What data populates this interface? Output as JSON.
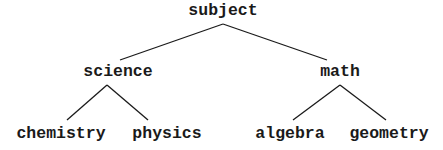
{
  "diagram": {
    "type": "tree",
    "line_color": "#1a1a1a",
    "nodes": {
      "root": {
        "label": "subject",
        "x": 223,
        "y": 2
      },
      "science": {
        "label": "science",
        "x": 118,
        "y": 63
      },
      "math": {
        "label": "math",
        "x": 340,
        "y": 63
      },
      "chemistry": {
        "label": "chemistry",
        "x": 61,
        "y": 125
      },
      "physics": {
        "label": "physics",
        "x": 167,
        "y": 125
      },
      "algebra": {
        "label": "algebra",
        "x": 290,
        "y": 125
      },
      "geometry": {
        "label": "geometry",
        "x": 389,
        "y": 125
      }
    },
    "edges": [
      {
        "from": "subject",
        "to": "science",
        "x1": 223,
        "y1": 24,
        "x2": 120,
        "y2": 60
      },
      {
        "from": "subject",
        "to": "math",
        "x1": 223,
        "y1": 24,
        "x2": 327,
        "y2": 60
      },
      {
        "from": "science",
        "to": "chemistry",
        "x1": 107,
        "y1": 85,
        "x2": 67,
        "y2": 120
      },
      {
        "from": "science",
        "to": "physics",
        "x1": 107,
        "y1": 85,
        "x2": 148,
        "y2": 120
      },
      {
        "from": "math",
        "to": "algebra",
        "x1": 340,
        "y1": 85,
        "x2": 293,
        "y2": 120
      },
      {
        "from": "math",
        "to": "geometry",
        "x1": 340,
        "y1": 85,
        "x2": 386,
        "y2": 120
      }
    ]
  }
}
